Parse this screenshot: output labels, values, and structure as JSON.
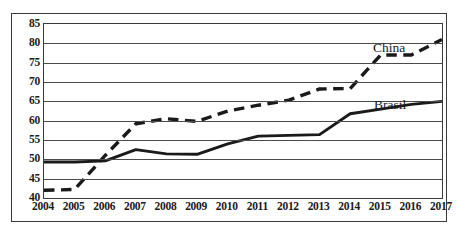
{
  "chart_data": {
    "type": "line",
    "title": "",
    "subtitle": "",
    "xlabel": "",
    "ylabel": "",
    "categories": [
      "2004",
      "2005",
      "2006",
      "2007",
      "2008",
      "2009",
      "2010",
      "2011",
      "2012",
      "2013",
      "2014",
      "2015",
      "2016",
      "2017"
    ],
    "x": [
      2004,
      2005,
      2006,
      2007,
      2008,
      2009,
      2010,
      2011,
      2012,
      2013,
      2014,
      2015,
      2016,
      2017
    ],
    "xlim": [
      2004,
      2017
    ],
    "ylim": [
      40,
      85
    ],
    "yticks": [
      40,
      45,
      50,
      55,
      60,
      65,
      70,
      75,
      80,
      85
    ],
    "xticks": [
      "2004",
      "2005",
      "2006",
      "2007",
      "2008",
      "2009",
      "2010",
      "2011",
      "2012",
      "2013",
      "2014",
      "2015",
      "2016",
      "2017"
    ],
    "grid": "horizontal",
    "legend_position": "inline-annotation",
    "series": [
      {
        "name": "China",
        "style": "dashed",
        "color": "#1a1a1a",
        "values": [
          42.0,
          42.2,
          51.0,
          59.2,
          60.5,
          59.8,
          62.5,
          64.0,
          65.3,
          68.2,
          68.3,
          77.0,
          77.0,
          81.0
        ]
      },
      {
        "name": "Brasil",
        "style": "solid",
        "color": "#1a1a1a",
        "values": [
          49.3,
          49.3,
          49.6,
          52.5,
          51.4,
          51.3,
          54.0,
          56.0,
          56.2,
          56.4,
          61.8,
          63.0,
          64.2,
          65.0
        ]
      }
    ],
    "annotations": [
      {
        "text": "China",
        "name": "china-series-label"
      },
      {
        "text": "Brasil",
        "name": "brasil-series-label"
      }
    ]
  },
  "figure": {
    "frame_color": "#3a3a3a",
    "background": "#ffffff",
    "gridline_color": "#4a4a4a"
  }
}
